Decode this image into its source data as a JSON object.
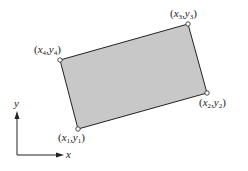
{
  "diagram": {
    "fill_color": "#c8c8c8",
    "stroke_color": "#222222",
    "vertices": [
      {
        "id": 1,
        "x": 78,
        "y": 129,
        "label_var_x": "x",
        "label_var_y": "y",
        "sub": "1",
        "label_pos": {
          "x": 58,
          "y": 146
        }
      },
      {
        "id": 2,
        "x": 207,
        "y": 93,
        "label_var_x": "x",
        "label_var_y": "y",
        "sub": "2",
        "label_pos": {
          "x": 198,
          "y": 108
        }
      },
      {
        "id": 3,
        "x": 188,
        "y": 24,
        "label_var_x": "x",
        "label_var_y": "y",
        "sub": "3",
        "label_pos": {
          "x": 170,
          "y": 16
        }
      },
      {
        "id": 4,
        "x": 60,
        "y": 60,
        "label_var_x": "x",
        "label_var_y": "y",
        "sub": "4",
        "label_pos": {
          "x": 34,
          "y": 53
        }
      }
    ],
    "axes": {
      "x_label": "x",
      "y_label": "y"
    }
  }
}
